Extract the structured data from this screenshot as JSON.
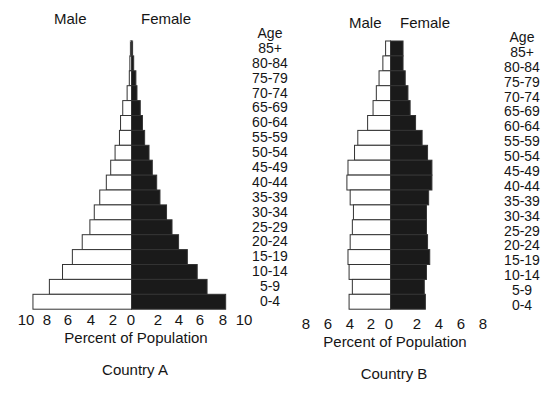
{
  "chart_data": [
    {
      "type": "bar",
      "subtype": "population-pyramid",
      "title": "Country A",
      "xlabel": "Percent of Population",
      "ylabel": "Age",
      "legend": [
        "Male",
        "Female"
      ],
      "categories": [
        "85+",
        "80-84",
        "75-79",
        "70-74",
        "65-69",
        "60-64",
        "55-59",
        "50-54",
        "45-49",
        "40-44",
        "35-39",
        "30-34",
        "25-29",
        "20-24",
        "15-19",
        "10-14",
        "5-9",
        "0-4"
      ],
      "series": [
        {
          "name": "Male",
          "color": "#ffffff",
          "values": [
            0.1,
            0.15,
            0.2,
            0.4,
            0.8,
            1.0,
            1.1,
            1.5,
            1.9,
            2.3,
            2.9,
            3.4,
            3.8,
            4.5,
            5.4,
            6.3,
            7.5,
            9.0
          ]
        },
        {
          "name": "Female",
          "color": "#1a1a1a",
          "values": [
            0.1,
            0.2,
            0.4,
            0.5,
            0.8,
            1.0,
            1.2,
            1.6,
            1.9,
            2.3,
            2.6,
            3.2,
            3.7,
            4.3,
            5.1,
            6.0,
            6.9,
            8.6
          ]
        }
      ],
      "xticks_left": [
        "10",
        "8",
        "6",
        "4",
        "2",
        "0"
      ],
      "xticks_right": [
        "2",
        "4",
        "6",
        "8",
        "10"
      ],
      "xlim": [
        -10,
        10
      ],
      "grid": false
    },
    {
      "type": "bar",
      "subtype": "population-pyramid",
      "title": "Country B",
      "xlabel": "Percent of Population",
      "ylabel": "Age",
      "legend": [
        "Male",
        "Female"
      ],
      "categories": [
        "85+",
        "80-84",
        "75-79",
        "70-74",
        "65-69",
        "60-64",
        "55-59",
        "50-54",
        "45-49",
        "40-44",
        "35-39",
        "30-34",
        "25-29",
        "20-24",
        "15-19",
        "10-14",
        "5-9",
        "0-4"
      ],
      "series": [
        {
          "name": "Male",
          "color": "#ffffff",
          "values": [
            0.45,
            0.7,
            1.05,
            1.3,
            1.6,
            2.1,
            3.0,
            3.3,
            3.9,
            4.0,
            3.7,
            3.4,
            3.5,
            3.7,
            3.9,
            3.8,
            3.5,
            3.8
          ]
        },
        {
          "name": "Female",
          "color": "#1a1a1a",
          "values": [
            1.15,
            1.15,
            1.35,
            1.6,
            1.8,
            2.3,
            2.9,
            3.4,
            3.8,
            3.8,
            3.5,
            3.3,
            3.3,
            3.4,
            3.6,
            3.3,
            3.1,
            3.2
          ]
        }
      ],
      "xticks_left": [
        "8",
        "6",
        "4",
        "2",
        "0"
      ],
      "xticks_right": [
        "2",
        "4",
        "6",
        "8"
      ],
      "xlim": [
        -8,
        8
      ],
      "grid": false
    }
  ],
  "labels": {
    "male": "Male",
    "female": "Female",
    "age": "Age",
    "xlabel": "Percent of Population",
    "country_a": "Country A",
    "country_b": "Country B"
  },
  "ages": [
    "85+",
    "80-84",
    "75-79",
    "70-74",
    "65-69",
    "60-64",
    "55-59",
    "50-54",
    "45-49",
    "40-44",
    "35-39",
    "30-34",
    "25-29",
    "20-24",
    "15-19",
    "10-14",
    "5-9",
    "0-4"
  ],
  "layout": {
    "a": {
      "center_x": 131.5,
      "px_per_pct": 10.95
    },
    "b": {
      "center_x": 390.5,
      "px_per_pct": 10.9
    },
    "row_top": 41,
    "row_h": 14.9
  }
}
